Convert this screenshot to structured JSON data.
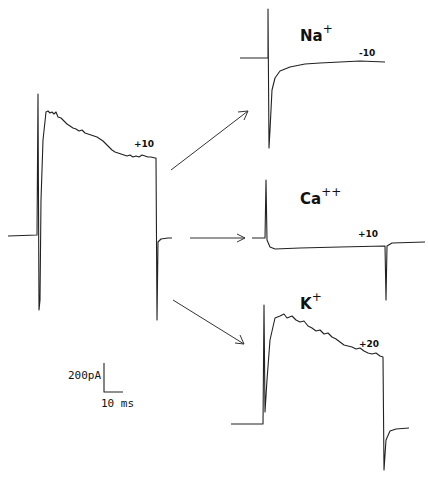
{
  "figure": {
    "main_trace": {
      "label": "+10"
    },
    "panels": [
      {
        "ion": "Na",
        "charge": "+",
        "voltage": "-10"
      },
      {
        "ion": "Ca",
        "charge": "++",
        "voltage": "+10"
      },
      {
        "ion": "K",
        "charge": "+",
        "voltage": "+20"
      }
    ],
    "scale_bar": {
      "current": "200pA",
      "time": "10 ms"
    }
  }
}
